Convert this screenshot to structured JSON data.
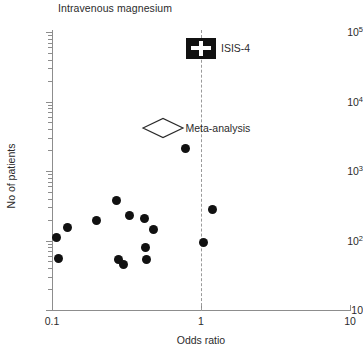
{
  "chart_data": {
    "type": "scatter",
    "title": "Intravenous magnesium",
    "xlabel": "Odds ratio",
    "ylabel": "No of patients",
    "xscale": "log",
    "yscale": "log",
    "xlim": [
      0.1,
      10
    ],
    "ylim": [
      10,
      100000
    ],
    "grid": false,
    "legend": "none",
    "x_tick_labels": [
      "0.1",
      "1",
      "10"
    ],
    "x_tick_values": [
      0.1,
      1,
      10
    ],
    "y_tick_labels": [
      "10",
      "10²",
      "10³",
      "10⁴",
      "10⁵"
    ],
    "y_tick_values": [
      10,
      100,
      1000,
      10000,
      100000
    ],
    "y_tick_base": [
      "10",
      "10",
      "10",
      "10",
      "10"
    ],
    "y_tick_exp": [
      "",
      "2",
      "3",
      "4",
      "5"
    ],
    "reference_line": {
      "x": 1,
      "style": "dashed",
      "label": "null effect"
    },
    "series": [
      {
        "name": "Individual trials",
        "marker": "filled-circle",
        "color": "#111111",
        "points": [
          {
            "x": 0.108,
            "y": 112
          },
          {
            "x": 0.11,
            "y": 55
          },
          {
            "x": 0.128,
            "y": 152
          },
          {
            "x": 0.2,
            "y": 192
          },
          {
            "x": 0.272,
            "y": 380
          },
          {
            "x": 0.278,
            "y": 53
          },
          {
            "x": 0.3,
            "y": 45
          },
          {
            "x": 0.33,
            "y": 230
          },
          {
            "x": 0.42,
            "y": 205
          },
          {
            "x": 0.425,
            "y": 80
          },
          {
            "x": 0.428,
            "y": 54
          },
          {
            "x": 0.48,
            "y": 145
          },
          {
            "x": 0.79,
            "y": 2100
          },
          {
            "x": 1.035,
            "y": 95
          },
          {
            "x": 1.19,
            "y": 275
          }
        ]
      }
    ],
    "annotations": [
      {
        "name": "ISIS-4",
        "label": "ISIS-4",
        "marker": "filled-square-with-white-cross",
        "x": 1.0,
        "y": 58000,
        "label_position": "right"
      },
      {
        "name": "Meta-analysis",
        "label": "Meta-analysis",
        "marker": "open-diamond",
        "x": 0.56,
        "y": 4200,
        "label_position": "right"
      }
    ]
  }
}
